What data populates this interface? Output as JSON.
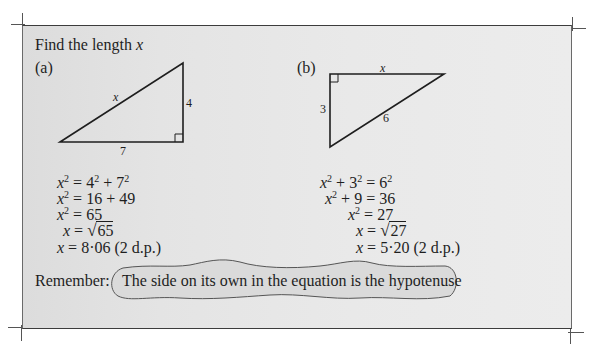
{
  "heading": {
    "prefix": "Find the length ",
    "variable": "x"
  },
  "part_a": {
    "label": "(a)",
    "triangle": {
      "hypotenuse_label": "x",
      "vertical_side_label": "4",
      "base_label": "7",
      "right_angle": "bottom-right"
    },
    "working": [
      {
        "lhs_var": "x",
        "lhs_exp": "2",
        "rhs": "= 4",
        "rhs_exp1": "2",
        "rhs_mid": " + 7",
        "rhs_exp2": "2"
      },
      {
        "lhs_var": "x",
        "lhs_exp": "2",
        "rhs": "= 16 + 49"
      },
      {
        "lhs_var": "x",
        "lhs_exp": "2",
        "rhs": "= 65"
      },
      {
        "lhs_var": "x",
        "rhs": "= ",
        "radical": "√",
        "radicand": "65"
      },
      {
        "lhs_var": "x",
        "rhs": "= 8·06 (2 d.p.)"
      }
    ]
  },
  "part_b": {
    "label": "(b)",
    "triangle": {
      "top_side_label": "x",
      "vertical_side_label": "3",
      "hypotenuse_label": "6",
      "right_angle": "top-left"
    },
    "working": [
      {
        "lhs_var": "x",
        "lhs_exp": "2",
        "lhs_mid": " + 3",
        "lhs_exp2": "2",
        "rhs": " = 6",
        "rhs_exp": "2"
      },
      {
        "lhs_var": "x",
        "lhs_exp": "2",
        "lhs_mid": " + 9",
        "rhs": " = 36"
      },
      {
        "lhs_var": "x",
        "lhs_exp": "2",
        "rhs": " = 27"
      },
      {
        "lhs_var": "x",
        "rhs": " = ",
        "radical": "√",
        "radicand": "27"
      },
      {
        "lhs_var": "x",
        "rhs": " = 5·20 (2 d.p.)"
      }
    ]
  },
  "remember": {
    "label": "Remember:",
    "note": "The side on its own in the equation is the hypotenuse"
  },
  "colors": {
    "panel_background": "#e6e6e6",
    "ink": "#1e1e1e",
    "cloud_fill": "#dadada",
    "cloud_stroke": "#555555"
  }
}
